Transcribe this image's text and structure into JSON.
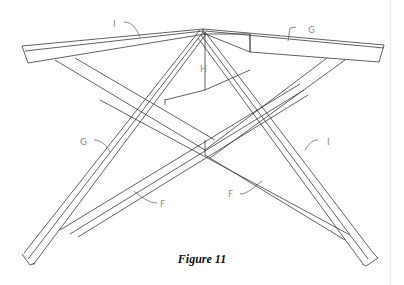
{
  "figure": {
    "caption": "Figure 11",
    "stroke_color": "#3a3a3a",
    "label_color": "#8a8a8a"
  },
  "labels": {
    "top_left_rail": "I",
    "top_right_rail": "G",
    "center_block": "H",
    "left_leg": "G",
    "right_leg": "I",
    "left_brace": "F",
    "right_brace": "F"
  }
}
